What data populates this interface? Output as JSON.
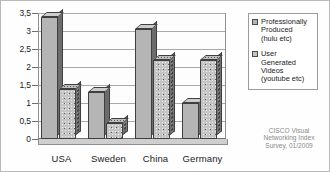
{
  "chart_data": {
    "type": "bar",
    "title": "",
    "xlabel": "",
    "ylabel": "",
    "ylim": [
      0,
      3.5
    ],
    "grid": true,
    "legend_position": "right",
    "categories": [
      "USA",
      "Sweden",
      "China",
      "Germany"
    ],
    "ytick_labels": [
      "0",
      "0,5",
      "1",
      "1,5",
      "2",
      "2,5",
      "3",
      "3,5"
    ],
    "ytick_values": [
      0,
      0.5,
      1,
      1.5,
      2,
      2.5,
      3,
      3.5
    ],
    "series": [
      {
        "name": "Professionally Produced (hulu etc)",
        "values": [
          3.4,
          1.3,
          3.05,
          1.0
        ]
      },
      {
        "name": "User Generated Videos (youtube etc)",
        "values": [
          1.4,
          0.45,
          2.2,
          2.2
        ]
      }
    ],
    "annotations": [
      "CISCO Visual Networking Index Survey, 01/2009"
    ]
  },
  "legend": {
    "entries": [
      "Professionally\nProduced\n(hulu etc)",
      "User\nGenerated\nVideos\n(youtube etc)"
    ]
  },
  "source_note": "CISCO Visual\nNetworking Index\nSurvey, 01/2009"
}
